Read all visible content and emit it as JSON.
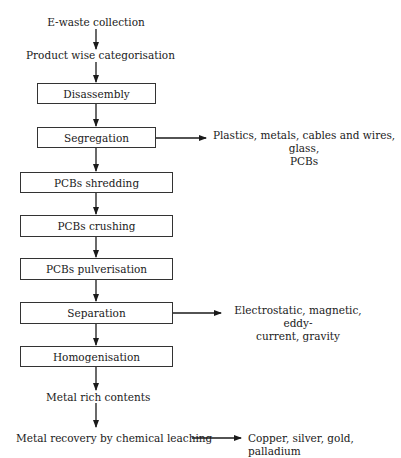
{
  "diagram": {
    "type": "flowchart",
    "steps": [
      {
        "id": "collection",
        "label": "E-waste collection",
        "boxed": false
      },
      {
        "id": "categorisation",
        "label": "Product wise categorisation",
        "boxed": false
      },
      {
        "id": "disassembly",
        "label": "Disassembly",
        "boxed": true
      },
      {
        "id": "segregation",
        "label": "Segregation",
        "boxed": true
      },
      {
        "id": "shredding",
        "label": "PCBs shredding",
        "boxed": true
      },
      {
        "id": "crushing",
        "label": "PCBs crushing",
        "boxed": true
      },
      {
        "id": "pulverisation",
        "label": "PCBs pulverisation",
        "boxed": true
      },
      {
        "id": "separation",
        "label": "Separation",
        "boxed": true
      },
      {
        "id": "homogenisation",
        "label": "Homogenisation",
        "boxed": true
      },
      {
        "id": "metal_rich",
        "label": "Metal rich contents",
        "boxed": false
      },
      {
        "id": "leaching",
        "label": "Metal recovery by chemical leaching",
        "boxed": false
      }
    ],
    "side_outputs": [
      {
        "from": "segregation",
        "line1": "Plastics, metals, cables and wires, glass,",
        "line2": "PCBs"
      },
      {
        "from": "separation",
        "line1": "Electrostatic, magnetic, eddy-",
        "line2": "current, gravity"
      },
      {
        "from": "leaching",
        "line1": "Copper, silver, gold, palladium",
        "line2": ""
      }
    ],
    "colors": {
      "line": "#1a1a1a",
      "box_border": "#333333",
      "background": "#ffffff"
    }
  }
}
